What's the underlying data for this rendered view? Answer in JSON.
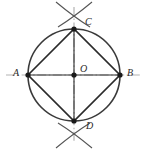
{
  "figure": {
    "name": "circle-inscribed-square-construction",
    "background_color": "#ffffff",
    "width": 147,
    "height": 151
  },
  "labels": {
    "a": "A",
    "b": "B",
    "c": "C",
    "d": "D",
    "o": "O"
  },
  "colors": {
    "circle_stroke": "#3a3a3a",
    "chord_stroke": "#2b2b2b",
    "centerline_stroke": "#b3b3b3",
    "arc_stroke": "#555555",
    "point_fill": "#1a1a1a",
    "label_color": "#2b2b2b"
  },
  "geometry": {
    "center": {
      "x": 74,
      "y": 75,
      "label": "O"
    },
    "radius": 46,
    "points": [
      {
        "id": "A",
        "x": 28,
        "y": 75
      },
      {
        "id": "B",
        "x": 120,
        "y": 75
      },
      {
        "id": "C",
        "x": 74,
        "y": 29
      },
      {
        "id": "D",
        "x": 74,
        "y": 121
      },
      {
        "id": "O",
        "x": 74,
        "y": 75
      }
    ],
    "inscribed_polygon": [
      "A",
      "C",
      "B",
      "D"
    ],
    "centerlines": [
      {
        "id": "horizontal-centerline",
        "x1": 6,
        "y1": 75,
        "x2": 142,
        "y2": 75
      },
      {
        "id": "vertical-centerline",
        "x1": 74,
        "y1": 7,
        "x2": 74,
        "y2": 143
      }
    ],
    "construction_arcs": {
      "top_crossing": {
        "x": 74,
        "y": 11
      },
      "bottom_crossing": {
        "x": 74,
        "y": 139
      }
    }
  }
}
